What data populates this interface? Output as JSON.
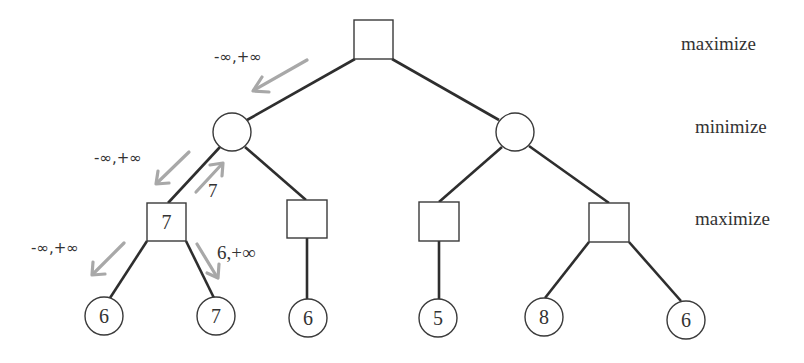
{
  "levels": [
    {
      "label": "maximize"
    },
    {
      "label": "minimize"
    },
    {
      "label": "maximize"
    }
  ],
  "nodes": {
    "root": {
      "shape": "square",
      "value": ""
    },
    "min_left": {
      "shape": "circle",
      "value": ""
    },
    "min_right": {
      "shape": "circle",
      "value": ""
    },
    "max_1": {
      "shape": "square",
      "value": "7"
    },
    "max_2": {
      "shape": "square",
      "value": ""
    },
    "max_3": {
      "shape": "square",
      "value": ""
    },
    "max_4": {
      "shape": "square",
      "value": ""
    },
    "leaves": [
      {
        "value": "6"
      },
      {
        "value": "7"
      },
      {
        "value": "6"
      },
      {
        "value": "5"
      },
      {
        "value": "8"
      },
      {
        "value": "6"
      }
    ]
  },
  "annotations": {
    "root_to_min_left": "-∞,+∞",
    "min_left_to_max_1": "-∞,+∞",
    "max_1_to_min_left": "7",
    "max_1_to_leaf_1": "-∞,+∞",
    "max_1_to_leaf_2": "6,+∞"
  },
  "colors": {
    "edge": "#2e2e2e",
    "node_stroke": "#3a3a3a",
    "arrow": "#a8a8a8",
    "text": "#333333"
  }
}
